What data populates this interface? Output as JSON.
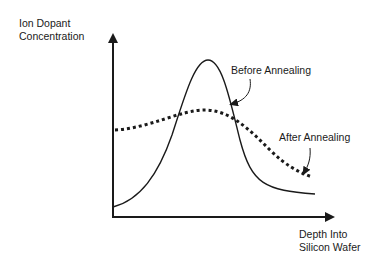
{
  "diagram": {
    "y_axis_label": [
      "Ion Dopant",
      "Concentration"
    ],
    "x_axis_label": [
      "Depth Into",
      "Silicon Wafer"
    ],
    "annotations": {
      "before": "Before Annealing",
      "after": "After Annealing"
    },
    "curves": [
      {
        "name": "Before Annealing",
        "style": "solid",
        "shape": "sharp peak near shallow depth, decays to low tail"
      },
      {
        "name": "After Annealing",
        "style": "dotted",
        "shape": "broad flat hump, gradually decreasing with depth"
      }
    ],
    "colors": {
      "line": "#1a1a1a",
      "background": "#ffffff"
    }
  }
}
